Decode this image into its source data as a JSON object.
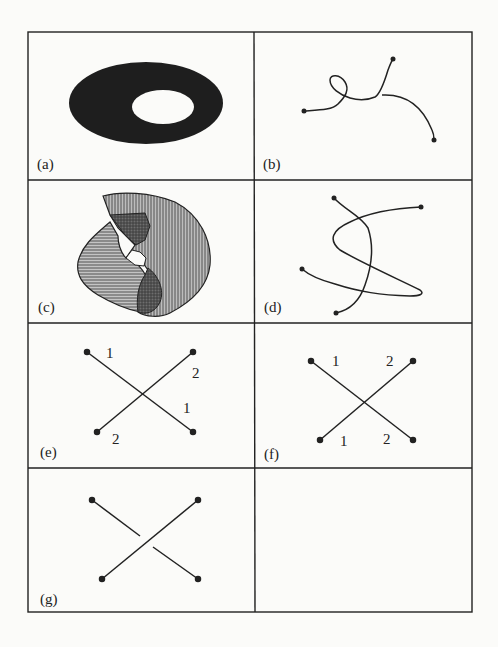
{
  "figure": {
    "panels": [
      {
        "id": "a",
        "label": "(a)",
        "content": "filled-ellipse-with-hole"
      },
      {
        "id": "b",
        "label": "(b)",
        "content": "self-looping-curve"
      },
      {
        "id": "c",
        "label": "(c)",
        "content": "overlapping-hatched-regions"
      },
      {
        "id": "d",
        "label": "(d)",
        "content": "self-crossing-curve"
      },
      {
        "id": "e",
        "label": "(e)",
        "content": "crossing-lines-labeled",
        "numbers": [
          "1",
          "2",
          "1",
          "2"
        ]
      },
      {
        "id": "f",
        "label": "(f)",
        "content": "crossing-lines-labeled",
        "numbers": [
          "1",
          "2",
          "1",
          "2"
        ]
      },
      {
        "id": "g",
        "label": "(g)",
        "content": "crossing-lines-gap"
      }
    ]
  },
  "colors": {
    "ink": "#222222",
    "paper": "#fbfbf9"
  }
}
